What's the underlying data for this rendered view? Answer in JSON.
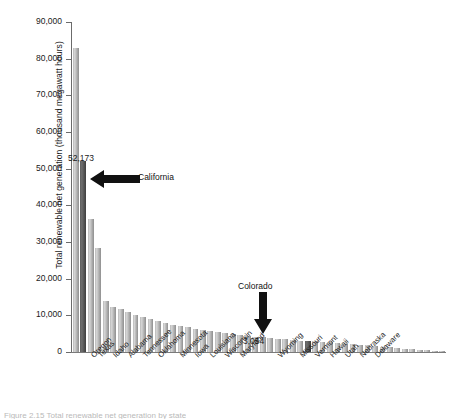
{
  "figure": {
    "caption_fragment": "Figure 2.15  Total renewable net generation by state"
  },
  "chart_data": {
    "type": "bar",
    "title": "",
    "xlabel": "",
    "ylabel": "Total renewable net generation (thousand megawatt hours)",
    "ylim": [
      0,
      90000
    ],
    "ytick_labels": [
      "0",
      "10,000",
      "20,000",
      "30,000",
      "40,000",
      "50,000",
      "60,000",
      "70,000",
      "80,000",
      "90,000"
    ],
    "ytick_values": [
      0,
      10000,
      20000,
      30000,
      40000,
      50000,
      60000,
      70000,
      80000,
      90000
    ],
    "grid": false,
    "legend": "none",
    "categories": [
      "Washington",
      "California",
      "Oregon",
      "Texas",
      "New York",
      "Idaho",
      "Montana",
      "Alabama",
      "Arizona",
      "Tennessee",
      "North Carolina",
      "Oklahoma",
      "South Dakota",
      "Georgia",
      "Minnesota",
      "Maine",
      "Iowa",
      "Virginia",
      "Louisiana",
      "Arkansas",
      "Wisconsin",
      "South Carolina",
      "Maryland",
      "Florida",
      "Michigan",
      "Pennsylvania",
      "Illinois",
      "Wyoming",
      "Nevada",
      "Kentucky",
      "Missouri",
      "Colorado",
      "Vermont",
      "West Virginia",
      "Hawaii",
      "New Mexico",
      "Utah",
      "New Hampshire",
      "Nebraska",
      "North Dakota",
      "Delaware",
      "Kansas",
      "Indiana",
      "Ohio",
      "New Jersey",
      "Connecticut",
      "Massachusetts",
      "Alaska",
      "Mississippi",
      "Rhode Island"
    ],
    "values": [
      83000,
      52173,
      36200,
      28500,
      14000,
      12400,
      11600,
      10900,
      10100,
      9600,
      9000,
      8400,
      7900,
      7400,
      7000,
      6700,
      6400,
      6100,
      5800,
      5500,
      5200,
      4950,
      4700,
      4450,
      4200,
      4000,
      3800,
      3600,
      3450,
      3250,
      3100,
      3054,
      2900,
      2750,
      2600,
      2450,
      2300,
      2150,
      2000,
      1850,
      1700,
      1500,
      1300,
      1100,
      950,
      800,
      650,
      500,
      370,
      240
    ],
    "visible_xtick_labels": [
      "Oregon",
      "Texas",
      "Idaho",
      "Alabama",
      "Tennessee",
      "Oklahoma",
      "Minnesota",
      "Iowa",
      "Louisiana",
      "Wisconsin",
      "Maryland",
      "Wyoming",
      "Missouri",
      "Vermont",
      "Hawaii",
      "Utah",
      "Nebraska",
      "Delaware"
    ],
    "highlighted": [
      {
        "name": "California",
        "value": 52173,
        "value_label": "52,173"
      },
      {
        "name": "Colorado",
        "value": 3054,
        "value_label": "3,054"
      }
    ],
    "annotations": [
      {
        "name": "California",
        "label": "California",
        "value_label": "52,173",
        "arrow": "left"
      },
      {
        "name": "Colorado",
        "label": "Colorado",
        "value_label": "3,054",
        "arrow": "down"
      }
    ],
    "colors": {
      "bar": "#b5b5b5",
      "highlight_bar": "#4f4f4f",
      "axis": "#6b6b6b",
      "text": "#1a1a1a",
      "background": "#ffffff"
    }
  }
}
